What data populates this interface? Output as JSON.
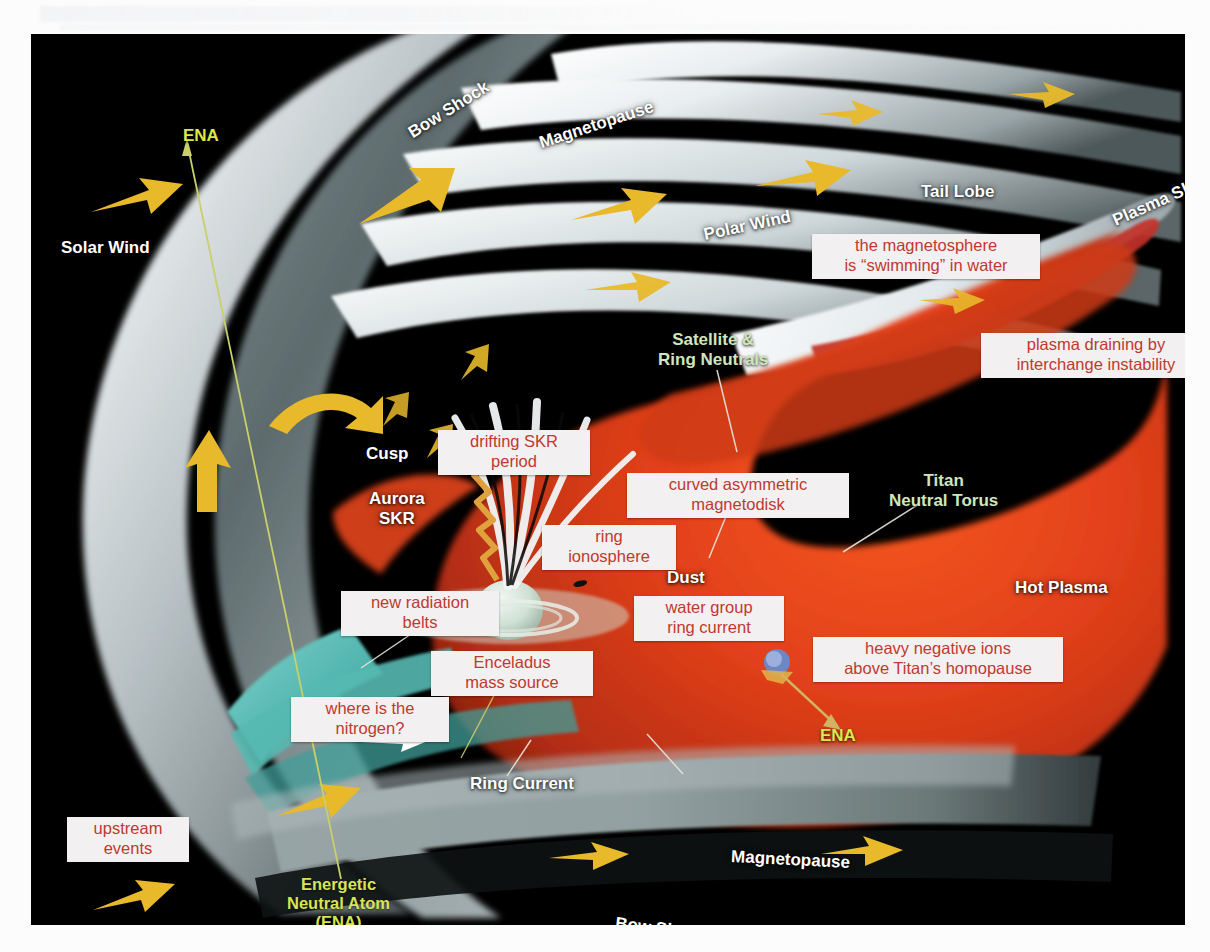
{
  "figure": {
    "plate_background": "#000000",
    "colors": {
      "callout_text": "#c0392f",
      "callout_bg": "#f3f0f2",
      "label_white": "#ffffff",
      "label_green": "#cfe6bb",
      "label_yellow": "#dbe84c",
      "arrow_yellow": "#e8b92a",
      "hot_plasma_red": "#e2401a",
      "ring_current_magenta": "#b8538a",
      "magnetodisk_mauve": "#9e7d8d",
      "dust_taupe": "#a1897f",
      "inner_green": "#8fbfa0",
      "cyan_wedge": "#4fb3ad",
      "magnetopause_grey": "#8c9b9b",
      "bow_shock_grey": "#c8cfd2"
    }
  },
  "white_labels": [
    {
      "id": "solar-wind",
      "text": "Solar Wind",
      "x": 30,
      "y": 204,
      "rot": 0
    },
    {
      "id": "bow-shock-top",
      "text": "Bow Shock",
      "x": 372,
      "y": 66,
      "rot": -32
    },
    {
      "id": "magnetopause-top",
      "text": "Magnetopause",
      "x": 506,
      "y": 81,
      "rot": -18
    },
    {
      "id": "tail-lobe",
      "text": "Tail Lobe",
      "x": 890,
      "y": 148,
      "rot": 0
    },
    {
      "id": "polar-wind",
      "text": "Polar Wind",
      "x": 672,
      "y": 182,
      "rot": -12
    },
    {
      "id": "plasma-sheet",
      "text": "Plasma Sheet",
      "x": 1078,
      "y": 155,
      "rot": -24
    },
    {
      "id": "cusp",
      "text": "Cusp",
      "x": 335,
      "y": 410,
      "rot": 0
    },
    {
      "id": "aurora-skr",
      "text": "Aurora\nSKR",
      "x": 338,
      "y": 455,
      "rot": 0
    },
    {
      "id": "dust",
      "text": "Dust",
      "x": 636,
      "y": 534,
      "rot": 0
    },
    {
      "id": "hot-plasma",
      "text": "Hot Plasma",
      "x": 984,
      "y": 544,
      "rot": 0
    },
    {
      "id": "ring-current",
      "text": "Ring Current",
      "x": 439,
      "y": 740,
      "rot": 0
    },
    {
      "id": "magnetopause-bottom",
      "text": "Magnetopause",
      "x": 700,
      "y": 816,
      "rot": 3
    },
    {
      "id": "bow-shock-bottom",
      "text": "Bow Shock",
      "x": 584,
      "y": 885,
      "rot": 7
    }
  ],
  "green_labels": [
    {
      "id": "satellite-ring-neutrals",
      "text": "Satellite &\nRing Neutrals",
      "x": 627,
      "y": 296,
      "rot": 0
    },
    {
      "id": "titan-neutral-torus",
      "text": "Titan\nNeutral Torus",
      "x": 858,
      "y": 437,
      "rot": 0
    }
  ],
  "yellow_labels": [
    {
      "id": "ena-top",
      "text": "ENA",
      "x": 152,
      "y": 92,
      "rot": 0,
      "size": "big"
    },
    {
      "id": "ena-titan",
      "text": "ENA",
      "x": 789,
      "y": 692,
      "rot": 0,
      "size": "big"
    },
    {
      "id": "ena-legend",
      "text": "Energetic\nNeutral Atom\n(ENA)",
      "x": 256,
      "y": 841,
      "rot": 0,
      "size": "small"
    }
  ],
  "callouts": [
    {
      "id": "swimming-in-water",
      "text": "the magnetosphere\nis “swimming” in water",
      "x": 781,
      "y": 200,
      "w": 216
    },
    {
      "id": "plasma-draining",
      "text": "plasma draining by\ninterchange instability",
      "x": 950,
      "y": 299,
      "w": 218
    },
    {
      "id": "drifting-skr",
      "text": "drifting SKR\nperiod",
      "x": 407,
      "y": 396,
      "w": 140
    },
    {
      "id": "curved-magnetodisk",
      "text": "curved asymmetric\nmagnetodisk",
      "x": 596,
      "y": 439,
      "w": 210
    },
    {
      "id": "ring-ionosphere",
      "text": "ring\nionosphere",
      "x": 511,
      "y": 491,
      "w": 122
    },
    {
      "id": "new-radiation-belts",
      "text": "new radiation\nbelts",
      "x": 310,
      "y": 557,
      "w": 146
    },
    {
      "id": "water-group-ring-current",
      "text": "water group\nring current",
      "x": 603,
      "y": 562,
      "w": 138
    },
    {
      "id": "heavy-negative-ions",
      "text": "heavy negative ions\nabove Titan’s homopause",
      "x": 782,
      "y": 603,
      "w": 238
    },
    {
      "id": "enceladus-mass-source",
      "text": "Enceladus\nmass source",
      "x": 400,
      "y": 617,
      "w": 150
    },
    {
      "id": "where-is-nitrogen",
      "text": "where is the\nnitrogen?",
      "x": 260,
      "y": 663,
      "w": 146
    },
    {
      "id": "upstream-events",
      "text": "upstream\nevents",
      "x": 36,
      "y": 783,
      "w": 110
    }
  ]
}
